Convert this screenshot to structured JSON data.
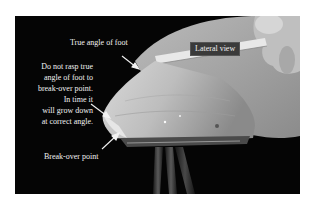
{
  "figure": {
    "background_color": "#050505",
    "labels": {
      "true_angle": "True angle of foot",
      "lateral_view": "Lateral view",
      "break_over": "Break-over point",
      "caption_lines": [
        "Do not rasp true",
        "angle of foot to",
        "break-over point.",
        "In time it",
        "will grow down",
        "at correct angle."
      ]
    },
    "arrows": [
      {
        "name": "true-angle-arrow",
        "target": "hoof wall at true angle"
      },
      {
        "name": "caption-arrow",
        "target": "toe of hoof"
      },
      {
        "name": "break-over-arrow",
        "target": "break-over point"
      }
    ]
  }
}
